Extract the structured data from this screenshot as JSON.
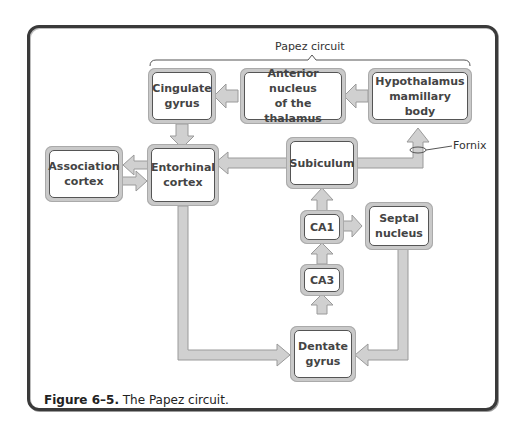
{
  "figure": {
    "group_label": "Papez circuit",
    "fornix_label": "Fornix",
    "caption_number": "Figure 6–5.",
    "caption_text": "The Papez circuit."
  },
  "nodes": {
    "cingulate": "Cingulate\ngyrus",
    "anterior": "Anterior nucleus\nof the thalamus",
    "hypothalamus": "Hypothalamus\nmamillary body",
    "association": "Association\ncortex",
    "entorhinal": "Entorhinal\ncortex",
    "subiculum": "Subiculum",
    "ca1": "CA1",
    "ca3": "CA3",
    "septal": "Septal\nnucleus",
    "dentate": "Dentate\ngyrus"
  },
  "edges": [
    {
      "from": "hypothalamus",
      "to": "anterior"
    },
    {
      "from": "anterior",
      "to": "cingulate"
    },
    {
      "from": "cingulate",
      "to": "entorhinal"
    },
    {
      "from": "entorhinal",
      "to": "association"
    },
    {
      "from": "association",
      "to": "entorhinal"
    },
    {
      "from": "subiculum",
      "to": "entorhinal"
    },
    {
      "from": "subiculum",
      "to": "hypothalamus",
      "via": "Fornix"
    },
    {
      "from": "ca1",
      "to": "subiculum"
    },
    {
      "from": "ca1",
      "to": "septal"
    },
    {
      "from": "ca3",
      "to": "ca1"
    },
    {
      "from": "dentate",
      "to": "ca3"
    },
    {
      "from": "entorhinal",
      "to": "dentate"
    },
    {
      "from": "septal",
      "to": "dentate"
    }
  ],
  "colors": {
    "arrow_fill": "#cfcfcf",
    "arrow_stroke": "#9a9a9a",
    "box_border": "#555555",
    "frame": "#3a3a3a"
  }
}
